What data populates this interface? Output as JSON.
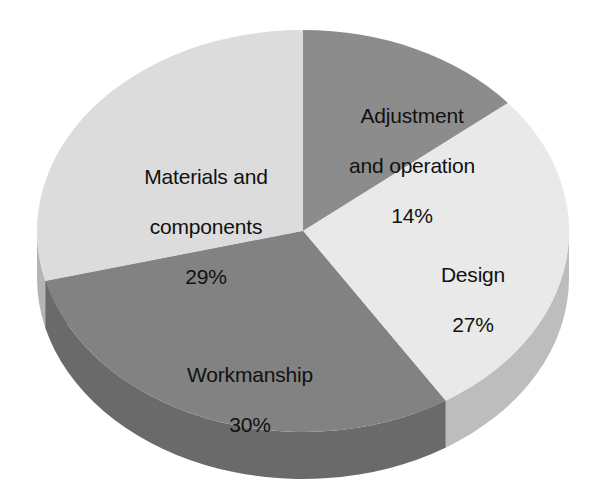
{
  "chart_data": {
    "type": "pie",
    "title": "",
    "subtitle": "",
    "xlabel": "",
    "ylabel": "",
    "legend_position": "none",
    "grid": false,
    "three_d": true,
    "categories": [
      "Adjustment and operation",
      "Design",
      "Workmanship",
      "Materials and components"
    ],
    "values": [
      14,
      27,
      30,
      29
    ],
    "value_unit": "%",
    "slices": [
      {
        "label": "Adjustment and operation",
        "label_line1": "Adjustment",
        "label_line2": "and operation",
        "value": 14,
        "value_text": "14%",
        "color": "#8c8c8c",
        "side_color": "#6f6f6f"
      },
      {
        "label": "Design",
        "label_line1": "Design",
        "label_line2": "",
        "value": 27,
        "value_text": "27%",
        "color": "#e9e9e9",
        "side_color": "#bdbdbd"
      },
      {
        "label": "Workmanship",
        "label_line1": "Workmanship",
        "label_line2": "",
        "value": 30,
        "value_text": "30%",
        "color": "#828282",
        "side_color": "#6a6a6a"
      },
      {
        "label": "Materials and components",
        "label_line1": "Materials and",
        "label_line2": "components",
        "value": 29,
        "value_text": "29%",
        "color": "#dcdcdc",
        "side_color": "#b4b4b4"
      }
    ],
    "background_color": "#ffffff",
    "text_color": "#111111"
  }
}
